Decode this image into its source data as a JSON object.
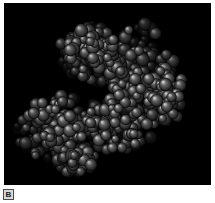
{
  "figure": {
    "panel_label": "B",
    "caption_visible": false,
    "background_color": "#ffffff",
    "panel": {
      "background_color": "#000000",
      "x": 4,
      "y": 3,
      "width": 207,
      "height": 182
    },
    "image_type": "molecular-space-filling-model",
    "rendering": {
      "style": "CPK space-filling spheres",
      "color_mode": "grayscale",
      "lighting": "top-left specular highlight",
      "sphere_base_colors": [
        "#2a2a2a",
        "#3a3a3a",
        "#4a4a4a",
        "#585858",
        "#666666"
      ],
      "sphere_highlight_colors": [
        "#8a8a8a",
        "#9e9e9e",
        "#b4b4b4",
        "#c8c8c8"
      ],
      "sphere_radius_px_min": 4,
      "sphere_radius_px_max": 7,
      "sphere_count": 980
    },
    "molecule_shape": {
      "description": "two-lobed globular macromolecule with a diagonal cleft",
      "lobes": [
        {
          "name": "upper-right-lobe",
          "center_x": 128,
          "center_y": 72,
          "radius_x": 52,
          "radius_y": 58,
          "density": 1.0
        },
        {
          "name": "upper-left-shoulder",
          "center_x": 88,
          "center_y": 50,
          "radius_x": 32,
          "radius_y": 30,
          "density": 0.85
        },
        {
          "name": "lower-left-lobe",
          "center_x": 56,
          "center_y": 128,
          "radius_x": 40,
          "radius_y": 38,
          "density": 0.95
        },
        {
          "name": "lower-right-mass",
          "center_x": 124,
          "center_y": 120,
          "radius_x": 42,
          "radius_y": 40,
          "density": 0.9
        },
        {
          "name": "bottom-tail",
          "center_x": 78,
          "center_y": 160,
          "radius_x": 22,
          "radius_y": 16,
          "density": 0.6
        },
        {
          "name": "right-edge-extension",
          "center_x": 166,
          "center_y": 92,
          "radius_x": 20,
          "radius_y": 34,
          "density": 0.7
        }
      ],
      "cleft": {
        "center_x": 92,
        "center_y": 92,
        "radius_x": 15,
        "radius_y": 11
      },
      "bounds": {
        "left": 15,
        "top": 18,
        "right": 185,
        "bottom": 176
      }
    }
  }
}
